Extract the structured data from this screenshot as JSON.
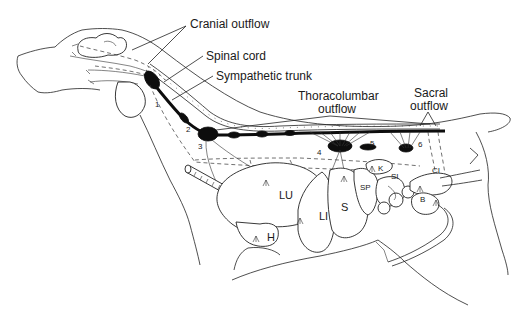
{
  "figure": {
    "callouts": [
      {
        "id": "cranial",
        "text": "Cranial outflow",
        "x": 190,
        "y": 28
      },
      {
        "id": "spinal",
        "text": "Spinal cord",
        "x": 206,
        "y": 60
      },
      {
        "id": "sympathetic",
        "text": "Sympathetic trunk",
        "x": 216,
        "y": 80
      },
      {
        "id": "thoracolumbar_1",
        "text": "Thoracolumbar",
        "x": 298,
        "y": 100
      },
      {
        "id": "thoracolumbar_2",
        "text": "outflow",
        "x": 318,
        "y": 113
      },
      {
        "id": "sacral_1",
        "text": "Sacral",
        "x": 414,
        "y": 97
      },
      {
        "id": "sacral_2",
        "text": "outflow",
        "x": 410,
        "y": 110
      }
    ],
    "organ_labels": [
      {
        "id": "LU",
        "text": "LU",
        "x": 279,
        "y": 199
      },
      {
        "id": "LI",
        "text": "LI",
        "x": 319,
        "y": 220
      },
      {
        "id": "S",
        "text": "S",
        "x": 341,
        "y": 211
      },
      {
        "id": "SP",
        "text": "SP",
        "x": 360,
        "y": 190
      },
      {
        "id": "SI",
        "text": "SI",
        "x": 391,
        "y": 179
      },
      {
        "id": "K",
        "text": "K",
        "x": 378,
        "y": 171
      },
      {
        "id": "CI",
        "text": "CI",
        "x": 432,
        "y": 173
      },
      {
        "id": "B",
        "text": "B",
        "x": 420,
        "y": 202
      },
      {
        "id": "H",
        "text": "H",
        "x": 267,
        "y": 241
      }
    ],
    "ganglion_numbers": [
      {
        "text": "1",
        "x": 155,
        "y": 107
      },
      {
        "text": "2",
        "x": 186,
        "y": 132
      },
      {
        "text": "3",
        "x": 198,
        "y": 149
      },
      {
        "text": "4",
        "x": 317,
        "y": 155
      },
      {
        "text": "5",
        "x": 370,
        "y": 146
      },
      {
        "text": "6",
        "x": 418,
        "y": 147
      }
    ]
  }
}
